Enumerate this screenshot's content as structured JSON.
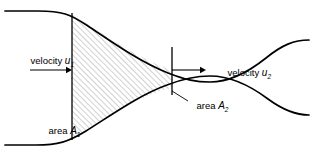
{
  "figure": {
    "kind": "venturi-pipe-continuity-diagram",
    "background_color": "#ffffff",
    "line_color": "#000000",
    "hatch_color": "#9a9a9a"
  },
  "labels": {
    "velocity_in": {
      "text": "velocity",
      "symbol": "u",
      "subscript": "1"
    },
    "velocity_out": {
      "text": "velocity",
      "symbol": "u",
      "subscript": "2"
    },
    "area_in": {
      "text": "area",
      "symbol": "A",
      "subscript": "1"
    },
    "area_out": {
      "text": "area",
      "symbol": "A",
      "subscript": "2"
    }
  },
  "geometry": {
    "pipe_top_path": "M 5 11 L 38 11 C 62 11 70 14 88 26 C 112 42 140 62 168 73 C 186 80 196 82 210 82 C 228 82 246 74 266 58 C 282 45 294 40 309 40",
    "pipe_bottom_path": "M 5 145 L 36 145 C 58 145 68 142 86 131 C 110 116 139 95 167 85 C 185 78 196 76 210 76 C 228 76 248 84 268 99 C 283 110 295 115 309 115",
    "control_volume_fill": "M 72 14 C 92 26 120 47 148 60 C 158 65 166 68 172 70 L 172 88 C 166 89 157 92 147 96 C 120 107 92 126 72 139 Z",
    "section1_line": {
      "x": 72,
      "y1": 13,
      "y2": 140
    },
    "section2_line": {
      "x": 172,
      "y1": 47,
      "y2": 95
    },
    "arrow_in": {
      "x1": 30,
      "y1": 70,
      "x2": 72,
      "y2": 70
    },
    "arrow_out": {
      "x1": 172,
      "y1": 70,
      "x2": 206,
      "y2": 70
    },
    "leader_area2": {
      "x1": 188,
      "y1": 101,
      "x2": 172,
      "y2": 91
    }
  },
  "text_positions": {
    "velocity_in": {
      "x": 12,
      "y": 64
    },
    "velocity_out": {
      "x": 209,
      "y": 76
    },
    "area_in": {
      "x": 30,
      "y": 134
    },
    "area_out": {
      "x": 178,
      "y": 109
    }
  }
}
